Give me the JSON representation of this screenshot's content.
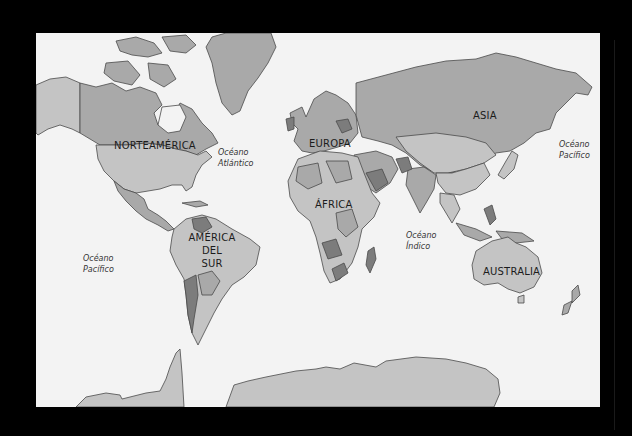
{
  "map": {
    "title": "",
    "style": "political world map, Mercator, grayscale",
    "colors": {
      "background": "#000000",
      "ocean": "#f3f3f3",
      "land_light": "#c4c4c4",
      "land_mid": "#a9a9a9",
      "land_dark": "#7c7c7c",
      "border": "#4a4a4a"
    },
    "continents": [
      {
        "id": "north-america",
        "label": "NORTEAMÉRICA",
        "x": 114,
        "y": 107
      },
      {
        "id": "europe",
        "label": "EUROPA",
        "x": 327,
        "y": 110
      },
      {
        "id": "africa",
        "label": "ÁFRICA",
        "x": 331,
        "y": 166
      },
      {
        "id": "asia",
        "label": "ASIA",
        "x": 485,
        "y": 81
      },
      {
        "id": "south-america",
        "lines": [
          "AMÉRICA",
          "DEL",
          "SUR"
        ],
        "x": 176,
        "y": 199
      },
      {
        "id": "australia",
        "label": "AUSTRALIA",
        "x": 476,
        "y": 233
      }
    ],
    "oceans": [
      {
        "id": "atlantic",
        "lines": [
          "Océano",
          "Atlántico"
        ],
        "x": 182,
        "y": 113
      },
      {
        "id": "pacific-west",
        "lines": [
          "Océano",
          "Pacífico"
        ],
        "x": 47,
        "y": 219
      },
      {
        "id": "pacific-east",
        "lines": [
          "Océano",
          "Pacífico"
        ],
        "x": 523,
        "y": 105
      },
      {
        "id": "indian",
        "lines": [
          "Océano",
          "Índico"
        ],
        "x": 369,
        "y": 196
      }
    ]
  }
}
